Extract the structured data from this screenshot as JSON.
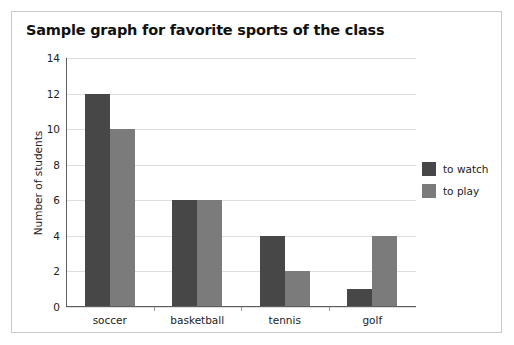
{
  "figure": {
    "title": "Sample graph for favorite sports of the class"
  },
  "legend": {
    "position": "right",
    "entries": [
      {
        "label": "to watch",
        "color": "#474747",
        "swatch_name": "legend-swatch-to-watch"
      },
      {
        "label": "to play",
        "color": "#7b7b7b",
        "swatch_name": "legend-swatch-to-play"
      }
    ]
  },
  "chart_data": {
    "type": "bar",
    "title": "Sample graph for favorite sports of the class",
    "xlabel": "",
    "ylabel": "Number of students",
    "categories": [
      "soccer",
      "basketball",
      "tennis",
      "golf"
    ],
    "series": [
      {
        "name": "to watch",
        "color": "#474747",
        "values": [
          12,
          6,
          4,
          1
        ]
      },
      {
        "name": "to play",
        "color": "#7b7b7b",
        "values": [
          10,
          6,
          2,
          4
        ]
      }
    ],
    "ylim": [
      0,
      14
    ],
    "ytick_step": 2,
    "yticks": [
      0,
      2,
      4,
      6,
      8,
      10,
      12,
      14
    ],
    "ytick_labels": [
      "0",
      "2",
      "4",
      "6",
      "8",
      "10",
      "12",
      "14"
    ],
    "grid": true,
    "grid_axis": "y",
    "grid_color": "#dedede",
    "legend_position": "right",
    "background": "#ffffff",
    "border_color": "#c9c9c9",
    "axis_color": "#5d5d5d"
  }
}
